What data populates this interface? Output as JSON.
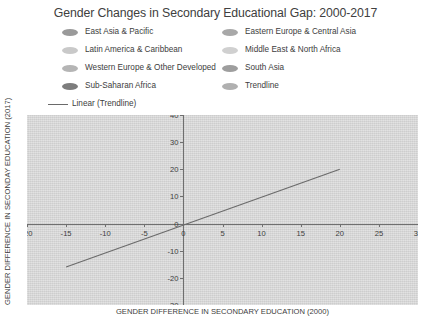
{
  "chart_data": {
    "type": "scatter",
    "title": "Gender Changes in Secondary Educational Gap: 2000-2017",
    "xlabel": "GENDER DIFFERENCE IN SECONDARY EDUCATION (2000)",
    "ylabel": "GENDER DIFFERENCE IN SECONDAY EDUCATION (2017)",
    "xlim": [
      -20,
      30
    ],
    "ylim": [
      -30,
      40
    ],
    "x_ticks": [
      -20,
      -15,
      -10,
      -5,
      0,
      5,
      10,
      15,
      20,
      25,
      30
    ],
    "x_tick_labels": [
      "-20",
      "-15",
      "-10",
      "-5",
      "0",
      "5",
      "10",
      "15",
      "20",
      "25",
      "30"
    ],
    "y_ticks": [
      -30,
      -20,
      -10,
      0,
      10,
      20,
      30,
      40
    ],
    "y_tick_labels": [
      "-30",
      "-20",
      "-10",
      "0",
      "10",
      "20",
      "30",
      "40"
    ],
    "grid": false,
    "legend_position": "top",
    "axes_cross_at_origin": true,
    "series": [
      {
        "name": "East Asia & Pacific",
        "marker": "ellipse",
        "color": "#9a9a9a",
        "values": []
      },
      {
        "name": "Latin America & Caribbean",
        "marker": "ellipse",
        "color": "#c9c9c9",
        "values": []
      },
      {
        "name": "Western Europe & Other Developed",
        "marker": "ellipse",
        "color": "#b5b5b5",
        "values": []
      },
      {
        "name": "Sub-Saharan Africa",
        "marker": "ellipse",
        "color": "#7d7d7d",
        "values": []
      },
      {
        "name": "Eastern Europe & Central Asia",
        "marker": "ellipse",
        "color": "#a8a8a8",
        "values": []
      },
      {
        "name": "Middle East & North Africa",
        "marker": "ellipse",
        "color": "#d0d0d0",
        "values": []
      },
      {
        "name": "South Asia",
        "marker": "ellipse",
        "color": "#9e9e9e",
        "values": []
      },
      {
        "name": "Trendline",
        "marker": "ellipse",
        "color": "#b0b0b0",
        "values": []
      }
    ],
    "trendline": {
      "label": "Linear (Trendline)",
      "marker": "line",
      "color": "#6a6a6a",
      "x_start": -15,
      "y_start": -16,
      "x_end": 20,
      "y_end": 20,
      "slope": 1.03,
      "intercept": -0.5
    }
  },
  "legend": {
    "items": [
      {
        "label": "East Asia & Pacific",
        "color": "#9a9a9a",
        "marker": "ellipse",
        "col": 0,
        "row": 0
      },
      {
        "label": "Latin America & Caribbean",
        "color": "#c9c9c9",
        "marker": "ellipse",
        "col": 0,
        "row": 1
      },
      {
        "label": "Western Europe & Other Developed",
        "color": "#b5b5b5",
        "marker": "ellipse",
        "col": 0,
        "row": 2
      },
      {
        "label": "Sub-Saharan Africa",
        "color": "#7d7d7d",
        "marker": "ellipse",
        "col": 0,
        "row": 3
      },
      {
        "label": "Linear (Trendline)",
        "color": "#6a6a6a",
        "marker": "line",
        "col": 0,
        "row": 4
      },
      {
        "label": "Eastern Europe & Central Asia",
        "color": "#a8a8a8",
        "marker": "ellipse",
        "col": 1,
        "row": 0
      },
      {
        "label": "Middle East & North Africa",
        "color": "#d0d0d0",
        "marker": "ellipse",
        "col": 1,
        "row": 1
      },
      {
        "label": "South Asia",
        "color": "#9e9e9e",
        "marker": "ellipse",
        "col": 1,
        "row": 2
      },
      {
        "label": "Trendline",
        "color": "#b0b0b0",
        "marker": "ellipse",
        "col": 1,
        "row": 3
      }
    ]
  },
  "colors": {
    "plot_background": "#d9d9d9",
    "page_background": "#ffffff",
    "axis": "#6f6f6f",
    "text": "#3d3d3d",
    "trendline": "#6a6a6a"
  }
}
